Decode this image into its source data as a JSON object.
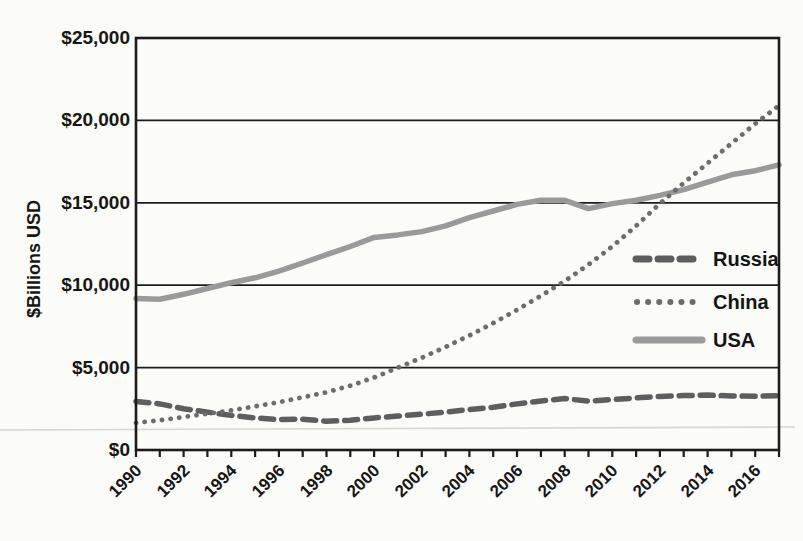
{
  "page": {
    "background": "#fbfbf8"
  },
  "chart_data": {
    "type": "line",
    "title": "",
    "xlabel": "",
    "ylabel": "$Billions USD",
    "x": [
      1990,
      1991,
      1992,
      1993,
      1994,
      1995,
      1996,
      1997,
      1998,
      1999,
      2000,
      2001,
      2002,
      2003,
      2004,
      2005,
      2006,
      2007,
      2008,
      2009,
      2010,
      2011,
      2012,
      2013,
      2014,
      2015,
      2016,
      2017
    ],
    "x_tick_labels": [
      "1990",
      "1992",
      "1994",
      "1996",
      "1998",
      "2000",
      "2002",
      "2004",
      "2006",
      "2008",
      "2010",
      "2012",
      "2014",
      "2016"
    ],
    "ylim": [
      0,
      25000
    ],
    "y_ticks": [
      0,
      5000,
      10000,
      15000,
      20000,
      25000
    ],
    "y_tick_labels": [
      "$0",
      "$5,000",
      "$10,000",
      "$15,000",
      "$20,000",
      "$25,000"
    ],
    "grid": "horizontal",
    "legend_position": "right-inside",
    "series": [
      {
        "name": "Russia",
        "style": "dashed",
        "color": "#5e5e5e",
        "values": [
          2950,
          2800,
          2500,
          2300,
          2100,
          1950,
          1850,
          1870,
          1750,
          1800,
          1950,
          2060,
          2170,
          2300,
          2450,
          2600,
          2800,
          2980,
          3120,
          2970,
          3060,
          3160,
          3250,
          3300,
          3330,
          3280,
          3260,
          3300
        ]
      },
      {
        "name": "China",
        "style": "dotted",
        "color": "#6d6d6d",
        "values": [
          1650,
          1800,
          2000,
          2200,
          2400,
          2650,
          2900,
          3200,
          3500,
          3900,
          4400,
          5000,
          5600,
          6250,
          6950,
          7700,
          8500,
          9350,
          10250,
          11250,
          12350,
          13600,
          14950,
          16200,
          17400,
          18600,
          19800,
          20900
        ]
      },
      {
        "name": "USA",
        "style": "solid",
        "color": "#9a9a9a",
        "values": [
          9200,
          9150,
          9450,
          9800,
          10150,
          10450,
          10850,
          11350,
          11850,
          12350,
          12900,
          13050,
          13250,
          13600,
          14100,
          14500,
          14900,
          15150,
          15150,
          14650,
          14950,
          15150,
          15450,
          15800,
          16250,
          16700,
          16950,
          17300
        ]
      }
    ]
  }
}
